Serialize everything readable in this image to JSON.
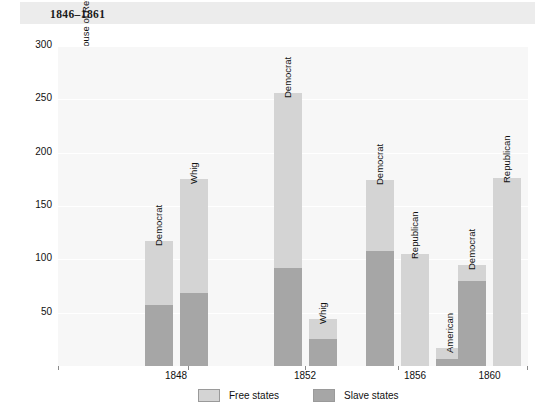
{
  "title": "1846–1861",
  "chart_data": {
    "type": "bar",
    "title": "1846–1861",
    "subtitle": "",
    "xlabel": "",
    "ylabel": "Party members in House of Representatives",
    "ylim": [
      0,
      300
    ],
    "yticks": [
      50,
      100,
      150,
      200,
      250,
      300
    ],
    "ytick_labels": [
      "50",
      "100",
      "150",
      "200",
      "250",
      "300"
    ],
    "grid": true,
    "stacked": true,
    "legend_position": "bottom",
    "categories": [
      "1848",
      "1852",
      "1856",
      "1860"
    ],
    "series": [
      {
        "name": "Free states",
        "color": "#d4d4d4"
      },
      {
        "name": "Slave states",
        "color": "#a6a6a6"
      }
    ],
    "groups": [
      {
        "category": "1848",
        "bars": [
          {
            "label": "Democrat",
            "total": 117,
            "free": 60,
            "slave": 57
          },
          {
            "label": "Whig",
            "total": 175,
            "free": 107,
            "slave": 68
          }
        ]
      },
      {
        "category": "1852",
        "bars": [
          {
            "label": "Democrat",
            "total": 256,
            "free": 164,
            "slave": 92
          },
          {
            "label": "Whig",
            "total": 44,
            "free": 19,
            "slave": 25
          }
        ]
      },
      {
        "category": "1856",
        "bars": [
          {
            "label": "Democrat",
            "total": 174,
            "free": 66,
            "slave": 108
          },
          {
            "label": "Republican",
            "total": 105,
            "free": 105,
            "slave": 0
          },
          {
            "label": "American",
            "total": 17,
            "free": 10,
            "slave": 7
          }
        ]
      },
      {
        "category": "1860",
        "bars": [
          {
            "label": "Democrat",
            "total": 95,
            "free": 15,
            "slave": 80
          },
          {
            "label": "Republican",
            "total": 176,
            "free": 176,
            "slave": 0
          }
        ]
      }
    ]
  },
  "legend": {
    "items": [
      {
        "label": "Free states",
        "color": "#d4d4d4"
      },
      {
        "label": "Slave states",
        "color": "#a6a6a6"
      }
    ]
  },
  "colors": {
    "free_states": "#d4d4d4",
    "slave_states": "#a6a6a6",
    "plot_background": "#f7f7f7",
    "title_band": "#ececec",
    "gridline": "#ffffff",
    "text": "#111111"
  }
}
